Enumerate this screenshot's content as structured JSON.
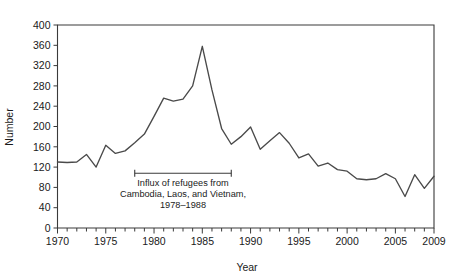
{
  "chart_data": {
    "type": "line",
    "title": "",
    "xlabel": "Year",
    "ylabel": "Number",
    "xlim": [
      1970,
      2009
    ],
    "ylim": [
      0,
      400
    ],
    "grid": false,
    "legend": "none",
    "x": [
      1970,
      1971,
      1972,
      1973,
      1974,
      1975,
      1976,
      1977,
      1978,
      1979,
      1980,
      1981,
      1982,
      1983,
      1984,
      1985,
      1986,
      1987,
      1988,
      1989,
      1990,
      1991,
      1992,
      1993,
      1994,
      1995,
      1996,
      1997,
      1998,
      1999,
      2000,
      2001,
      2002,
      2003,
      2004,
      2005,
      2006,
      2007,
      2008,
      2009
    ],
    "values": [
      130,
      129,
      130,
      145,
      120,
      163,
      147,
      152,
      168,
      185,
      220,
      256,
      250,
      254,
      280,
      358,
      272,
      196,
      165,
      180,
      199,
      155,
      172,
      188,
      167,
      138,
      146,
      122,
      128,
      115,
      112,
      97,
      95,
      97,
      107,
      97,
      62,
      105,
      78,
      102
    ],
    "series": [
      {
        "name": "Number",
        "values": [
          130,
          129,
          130,
          145,
          120,
          163,
          147,
          152,
          168,
          185,
          220,
          256,
          250,
          254,
          280,
          358,
          272,
          196,
          165,
          180,
          199,
          155,
          172,
          188,
          167,
          138,
          146,
          122,
          128,
          115,
          112,
          97,
          95,
          97,
          107,
          97,
          62,
          105,
          78,
          102
        ]
      }
    ],
    "y_ticks": [
      0,
      40,
      80,
      120,
      160,
      200,
      240,
      280,
      320,
      360,
      400
    ],
    "x_ticks_major": [
      1970,
      1975,
      1980,
      1985,
      1990,
      1995,
      2000,
      2005,
      2009
    ],
    "x_tick_labels": [
      "1970",
      "1975",
      "1980",
      "1985",
      "1990",
      "1995",
      "2000",
      "2005",
      "2009"
    ],
    "y_tick_labels": [
      "0",
      "40",
      "80",
      "120",
      "160",
      "200",
      "240",
      "280",
      "320",
      "360",
      "400"
    ],
    "annotations": [
      {
        "name": "refugee-influx-bracket",
        "line1": "Influx of refugees from",
        "line2": "Cambodia, Laos, and Vietnam,",
        "line3": "1978–1988",
        "span_start": 1978,
        "span_end": 1988,
        "span_value": 108
      }
    ],
    "colors": {
      "line": "#4a4a4a",
      "axis": "#3a3a3a",
      "text": "#1a1a1a",
      "background": "#ffffff"
    }
  }
}
